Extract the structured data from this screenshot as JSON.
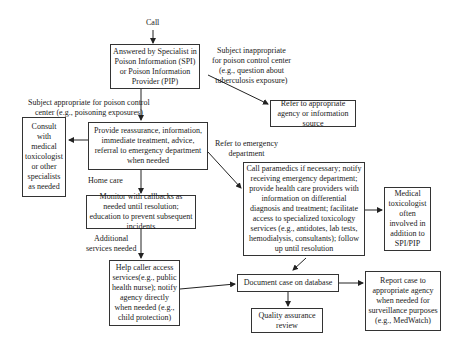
{
  "nodes": {
    "call": "Call",
    "answered": "Answered by Specialist in Poison Information (SPI) or Poison Information Provider (PIP)",
    "refer_agency": "Refer to appropriate agency or information source",
    "provide": "Provide reassurance, information, immediate treatment, advice, referral to emergency department when needed",
    "consult": "Consult with medical toxicologist or other specialists as needed",
    "monitor": "Monitor with callbacks as needed until resolution; education to prevent subsequent incidents",
    "paramedics": "Call paramedics if necessary; notify receiving emergency department; provide health care providers with information on differential diagnosis and treatment; facilitate access to specialized toxicology services (e.g., antidotes, lab tests, hemodialysis, consultants); follow up until resolution",
    "medical_tox": "Medical toxicologist often involved in addition to SPI/PIP",
    "help_caller": "Help caller access services(e.g., public health nurse); notify agency directly when needed (e.g., child protection)",
    "document": "Document case on database",
    "quality": "Quality assurance review",
    "report": "Report case to appropriate agency when needed for surveillance purposes (e.g., MedWatch)"
  },
  "edge_labels": {
    "inappropriate_1": "Subject inappropriate",
    "inappropriate_2": "for poison control center",
    "inappropriate_3": "(e.g., question about",
    "inappropriate_4": "tuberculosis exposure)",
    "appropriate_1": "Subject appropriate for poison control",
    "appropriate_2": "center (e.g., poisoning exposures)",
    "emergency_1": "Refer to emergency",
    "emergency_2": "department",
    "home_care": "Home care",
    "additional_1": "Additional",
    "additional_2": "services needed"
  }
}
